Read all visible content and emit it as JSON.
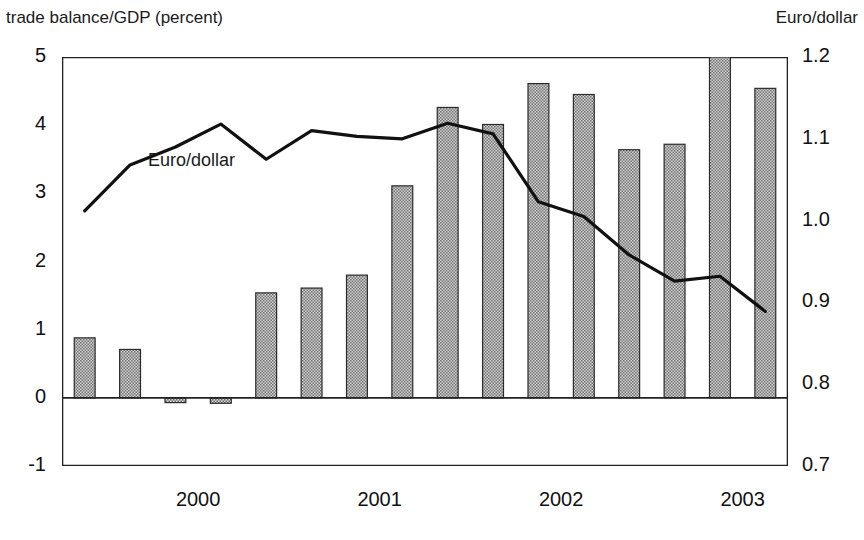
{
  "titles": {
    "left": "trade balance/GDP (percent)",
    "right": "Euro/dollar"
  },
  "annotations": {
    "line_series_label": "Euro/dollar"
  },
  "axes": {
    "left_ticks": [
      "5",
      "4",
      "3",
      "2",
      "1",
      "0",
      "-1"
    ],
    "right_ticks": [
      "1.2",
      "1.1",
      "1.0",
      "0.9",
      "0.8",
      "0.7"
    ],
    "x_ticks": [
      "2000",
      "2001",
      "2002",
      "2003"
    ]
  },
  "colors": {
    "bar_fill": "#a8a8a8",
    "bar_stroke": "#2b2b2b",
    "line": "#111111",
    "axis": "#222222",
    "text": "#111111",
    "background": "#ffffff"
  },
  "chart_data": {
    "type": "bar",
    "title": "",
    "subtitle": "",
    "xlabel": "",
    "ylabel": "trade balance/GDP (percent)",
    "y2label": "Euro/dollar",
    "ylim": [
      -1,
      5
    ],
    "y2lim": [
      0.7,
      1.2
    ],
    "grid": false,
    "legend": "none",
    "categories": [
      "1999Q4",
      "2000Q1",
      "2000Q2",
      "2000Q3",
      "2000Q4",
      "2001Q1",
      "2001Q2",
      "2001Q3",
      "2001Q4",
      "2002Q1",
      "2002Q2",
      "2002Q3",
      "2002Q4",
      "2003Q1",
      "2003Q2",
      "2003Q3"
    ],
    "series": [
      {
        "name": "trade balance/GDP (percent)",
        "type": "bar",
        "axis": "left",
        "values": [
          0.88,
          0.71,
          -0.07,
          -0.08,
          1.54,
          1.61,
          1.8,
          3.11,
          4.26,
          4.01,
          4.61,
          4.45,
          3.64,
          3.72,
          5.0,
          4.54
        ]
      },
      {
        "name": "Euro/dollar",
        "type": "line",
        "axis": "right",
        "values": [
          1.012,
          1.068,
          1.09,
          1.118,
          1.075,
          1.11,
          1.103,
          1.1,
          1.119,
          1.106,
          1.023,
          1.005,
          0.958,
          0.926,
          0.932,
          0.889
        ]
      }
    ]
  }
}
